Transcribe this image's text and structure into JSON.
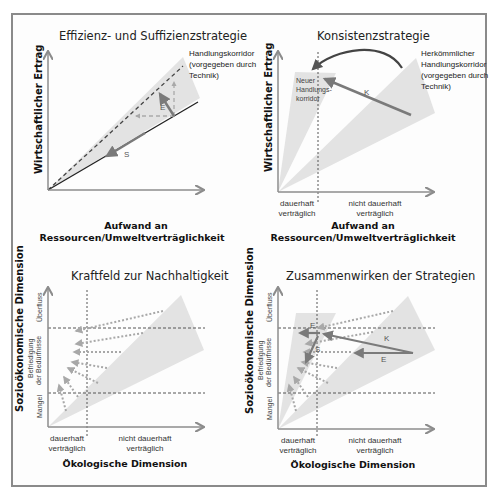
{
  "panels": {
    "effizienz": {
      "title": "Effizienz- und Suffizienzstrategie",
      "ylabel": "Wirtschaftlicher Ertrag",
      "xlabel_1": "Aufwand an",
      "xlabel_2": "Ressourcen/Umweltverträglichkeit",
      "corridor_1": "Handlungskorridor",
      "corridor_2": "(vorgegeben durch",
      "corridor_3": "Technik)",
      "arrow_e": "E",
      "arrow_s": "S"
    },
    "konsistenz": {
      "title": "Konsistenzstrategie",
      "ylabel": "Wirtschaftlicher Ertrag",
      "xlabel_1": "Aufwand an",
      "xlabel_2": "Ressourcen/Umweltverträglichkeit",
      "old_corridor_1": "Herkömmlicher",
      "old_corridor_2": "Handlungskorridor",
      "old_corridor_3": "(vorgegeben durch",
      "old_corridor_4": "Technik)",
      "new_corridor_1": "Neuer",
      "new_corridor_2": "Handlungs-",
      "new_corridor_3": "korridor",
      "arrow_k": "K",
      "zone_left_1": "dauerhaft",
      "zone_left_2": "verträglich",
      "zone_right_1": "nicht dauerhaft",
      "zone_right_2": "verträglich"
    },
    "kraftfeld": {
      "title": "Kraftfeld zur Nachhaltigkeit",
      "ylabel": "Sozioökonomische Dimension",
      "xlabel": "Ökologische Dimension",
      "band_top": "Überfluss",
      "band_mid_1": "Befriedigung",
      "band_mid_2": "der Bedürfnisse",
      "band_low": "Mangel",
      "zone_left_1": "dauerhaft",
      "zone_left_2": "verträglich",
      "zone_right_1": "nicht dauerhaft",
      "zone_right_2": "verträglich"
    },
    "zusammenwirken": {
      "title": "Zusammenwirken der Strategien",
      "ylabel": "Sozioökonomische Dimension",
      "xlabel": "Ökologische Dimension",
      "band_top": "Überfluss",
      "band_mid_1": "Befriedigung",
      "band_mid_2": "der Bedürfnisse",
      "band_low": "Mangel",
      "zone_left_1": "dauerhaft",
      "zone_left_2": "verträglich",
      "zone_right_1": "nicht dauerhaft",
      "zone_right_2": "verträglich",
      "arrow_e_top": "E",
      "arrow_s": "S",
      "arrow_k": "K",
      "arrow_e": "E"
    }
  },
  "colors": {
    "corridor_fill": "#e3e3e3",
    "axis": "#8c8c8c",
    "arrow": "#7a7a7a",
    "dotted_arrow": "#a8a8a8",
    "frame": "#8a8a8a"
  }
}
